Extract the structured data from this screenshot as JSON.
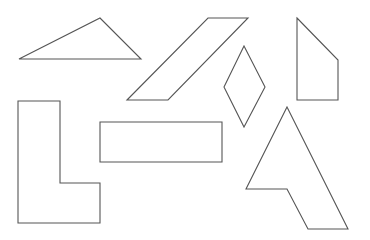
{
  "diagram": {
    "background": "#ffffff",
    "stroke_color": "#555555",
    "shapes": [
      {
        "name": "triangle",
        "points": "19,59 100,18 141,59"
      },
      {
        "name": "parallelogram",
        "points": "127,100 208,18 248,18 168,100"
      },
      {
        "name": "rhombus",
        "points": "244,46 265,87 244,127 224,87"
      },
      {
        "name": "pentagon",
        "points": "297,18 338,60 338,100 297,100"
      },
      {
        "name": "l-shape",
        "points": "18,101 60,101 60,183 100,183 100,223 18,223"
      },
      {
        "name": "rectangle",
        "points": "100,122 222,122 222,162 100,162"
      },
      {
        "name": "arrow-pentagon",
        "points": "287,107 348,229 308,229 287,189 246,189"
      }
    ]
  }
}
